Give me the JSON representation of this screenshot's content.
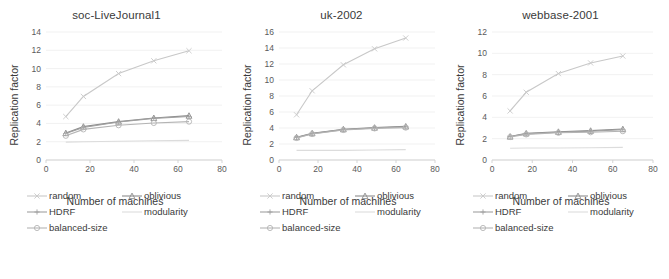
{
  "figure": {
    "width": 669,
    "height": 279,
    "background": "#ffffff"
  },
  "series_meta": [
    {
      "key": "random",
      "label": "random",
      "color": "#c8c8c8",
      "marker": "cross"
    },
    {
      "key": "oblivious",
      "label": "oblivious",
      "color": "#8c8c8c",
      "marker": "triangle"
    },
    {
      "key": "HDRF",
      "label": "HDRF",
      "color": "#a0a0a0",
      "marker": "plus"
    },
    {
      "key": "modularity",
      "label": "modularity",
      "color": "#dcdcdc",
      "marker": "line"
    },
    {
      "key": "balanced-size",
      "label": "balanced-size",
      "color": "#b4b4b4",
      "marker": "circle"
    }
  ],
  "legend": {
    "items": [
      "random",
      "oblivious",
      "HDRF",
      "modularity",
      "balanced-size"
    ],
    "order": [
      [
        "random",
        "oblivious"
      ],
      [
        "HDRF",
        "modularity"
      ],
      [
        "balanced-size",
        ""
      ]
    ]
  },
  "chart_data": [
    {
      "type": "line",
      "title": "soc-LiveJournal1",
      "xlabel": "Number of machines",
      "ylabel": "Replication factor",
      "x": [
        9,
        17,
        33,
        49,
        65
      ],
      "xlim": [
        0,
        80
      ],
      "xticks": [
        0,
        20,
        40,
        60,
        80
      ],
      "ylim": [
        0,
        14
      ],
      "yticks": [
        0,
        2,
        4,
        6,
        8,
        10,
        12,
        14
      ],
      "grid": true,
      "legend_position": "below",
      "series": [
        {
          "name": "random",
          "values": [
            4.75,
            6.95,
            9.45,
            10.85,
            11.95
          ]
        },
        {
          "name": "oblivious",
          "values": [
            2.95,
            3.65,
            4.2,
            4.6,
            4.85
          ]
        },
        {
          "name": "HDRF",
          "values": [
            2.9,
            3.55,
            4.15,
            4.55,
            4.75
          ]
        },
        {
          "name": "balanced-size",
          "values": [
            2.65,
            3.35,
            3.8,
            4.05,
            4.2
          ]
        },
        {
          "name": "modularity",
          "values": [
            1.95,
            2.0,
            2.05,
            2.1,
            2.15
          ]
        }
      ]
    },
    {
      "type": "line",
      "title": "uk-2002",
      "xlabel": "Number of machines",
      "ylabel": "Replication factor",
      "x": [
        9,
        17,
        33,
        49,
        65
      ],
      "xlim": [
        0,
        80
      ],
      "xticks": [
        0,
        20,
        40,
        60,
        80
      ],
      "ylim": [
        0,
        16
      ],
      "yticks": [
        0,
        2,
        4,
        6,
        8,
        10,
        12,
        14,
        16
      ],
      "grid": true,
      "legend_position": "below",
      "series": [
        {
          "name": "random",
          "values": [
            5.65,
            8.65,
            11.9,
            13.9,
            15.25
          ]
        },
        {
          "name": "oblivious",
          "values": [
            2.85,
            3.35,
            3.85,
            4.05,
            4.2
          ]
        },
        {
          "name": "HDRF",
          "values": [
            2.8,
            3.3,
            3.8,
            4.0,
            4.15
          ]
        },
        {
          "name": "balanced-size",
          "values": [
            2.75,
            3.25,
            3.75,
            3.95,
            4.05
          ]
        },
        {
          "name": "modularity",
          "values": [
            1.2,
            1.2,
            1.2,
            1.25,
            1.3
          ]
        }
      ]
    },
    {
      "type": "line",
      "title": "webbase-2001",
      "xlabel": "Number of machines",
      "ylabel": "Replication factor",
      "x": [
        9,
        17,
        33,
        49,
        65
      ],
      "xlim": [
        0,
        80
      ],
      "xticks": [
        0,
        20,
        40,
        60,
        80
      ],
      "ylim": [
        0,
        12
      ],
      "yticks": [
        0,
        2,
        4,
        6,
        8,
        10,
        12
      ],
      "grid": true,
      "legend_position": "below",
      "series": [
        {
          "name": "random",
          "values": [
            4.6,
            6.35,
            8.1,
            9.1,
            9.75
          ]
        },
        {
          "name": "oblivious",
          "values": [
            2.2,
            2.5,
            2.65,
            2.75,
            2.9
          ]
        },
        {
          "name": "HDRF",
          "values": [
            2.2,
            2.45,
            2.6,
            2.7,
            2.85
          ]
        },
        {
          "name": "balanced-size",
          "values": [
            2.15,
            2.4,
            2.55,
            2.6,
            2.7
          ]
        },
        {
          "name": "modularity",
          "values": [
            1.1,
            1.12,
            1.13,
            1.15,
            1.18
          ]
        }
      ]
    }
  ]
}
